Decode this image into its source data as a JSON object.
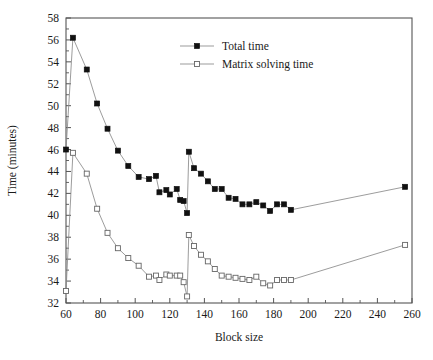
{
  "chart_data": {
    "type": "line",
    "title": "",
    "xlabel": "Block size",
    "ylabel": "Time (minutes)",
    "xlim": [
      60,
      260
    ],
    "ylim": [
      32,
      58
    ],
    "xticks": [
      60,
      80,
      100,
      120,
      140,
      160,
      180,
      200,
      220,
      240,
      260
    ],
    "yticks": [
      32,
      34,
      36,
      38,
      40,
      42,
      44,
      46,
      48,
      50,
      52,
      54,
      56,
      58
    ],
    "xminor_step": 10,
    "yminor_step": 1,
    "grid": false,
    "legend_position": "top-center",
    "series": [
      {
        "name": "Total time",
        "marker": "filled-square",
        "x": [
          60,
          64,
          72,
          78,
          84,
          90,
          96,
          102,
          108,
          112,
          114,
          118,
          120,
          124,
          126,
          128,
          130,
          131,
          134,
          138,
          142,
          146,
          150,
          154,
          158,
          162,
          166,
          170,
          174,
          178,
          182,
          186,
          190,
          256
        ],
        "y": [
          46.0,
          56.2,
          53.3,
          50.2,
          47.9,
          45.9,
          44.5,
          43.5,
          43.3,
          43.6,
          42.1,
          42.3,
          41.9,
          42.4,
          41.4,
          41.3,
          40.2,
          45.8,
          44.3,
          43.8,
          43.1,
          42.4,
          42.4,
          41.6,
          41.5,
          41.0,
          41.0,
          41.2,
          40.9,
          40.4,
          41.0,
          41.0,
          40.5,
          42.6
        ]
      },
      {
        "name": "Matrix solving time",
        "marker": "open-square",
        "x": [
          60,
          64,
          72,
          78,
          84,
          90,
          96,
          102,
          108,
          112,
          114,
          118,
          120,
          124,
          126,
          128,
          130,
          131,
          134,
          138,
          142,
          146,
          150,
          154,
          158,
          162,
          166,
          170,
          174,
          178,
          182,
          186,
          190,
          256
        ],
        "y": [
          33.1,
          45.7,
          43.8,
          40.6,
          38.4,
          37.0,
          36.1,
          35.4,
          34.4,
          34.5,
          34.1,
          34.6,
          34.5,
          34.5,
          34.5,
          33.9,
          32.6,
          38.2,
          37.2,
          36.4,
          35.8,
          35.1,
          34.5,
          34.4,
          34.3,
          34.2,
          34.1,
          34.4,
          33.8,
          33.6,
          34.1,
          34.1,
          34.1,
          37.3
        ]
      }
    ]
  },
  "legend": {
    "entries": [
      {
        "label": "Total time"
      },
      {
        "label": "Matrix solving time"
      }
    ]
  }
}
